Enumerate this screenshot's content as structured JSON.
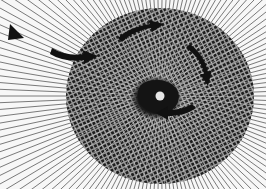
{
  "image": {
    "description": "Moire pattern: radial lines converging on a center overlaid by a dotted circular disc, with black curved arrows indicating clockwise rotation around a dark central spot with a bright dot",
    "subject": "moire-rotation-illusion",
    "colors": {
      "background": "#f7f7f7",
      "lines": "#6b6b6b",
      "dots": "#1e1e1e",
      "arrows": "#111111",
      "center_blob": "#151515",
      "center_dot": "#e6e6e6"
    },
    "rotation_direction": "clockwise",
    "arrow_count": 5
  }
}
